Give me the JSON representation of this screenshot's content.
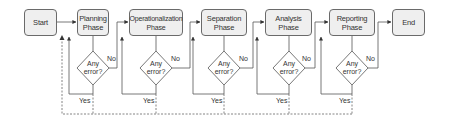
{
  "diagram": {
    "type": "flowchart",
    "nodes": {
      "start": "Start",
      "planning": {
        "line1": "Planning",
        "line2": "Phase"
      },
      "operationalization": {
        "line1": "Operationalization",
        "line2": "Phase"
      },
      "separation": {
        "line1": "Separation",
        "line2": "Phase"
      },
      "analysis": {
        "line1": "Analysis",
        "line2": "Phase"
      },
      "reporting": {
        "line1": "Reporting",
        "line2": "Phase"
      },
      "end": "End"
    },
    "decision": {
      "line1": "Any",
      "line2": "error?"
    },
    "edge_labels": {
      "no": "No",
      "yes": "Yes"
    },
    "colors": {
      "box_fill": "#efefef",
      "stroke": "#6a6a6a",
      "text": "#333333"
    }
  }
}
